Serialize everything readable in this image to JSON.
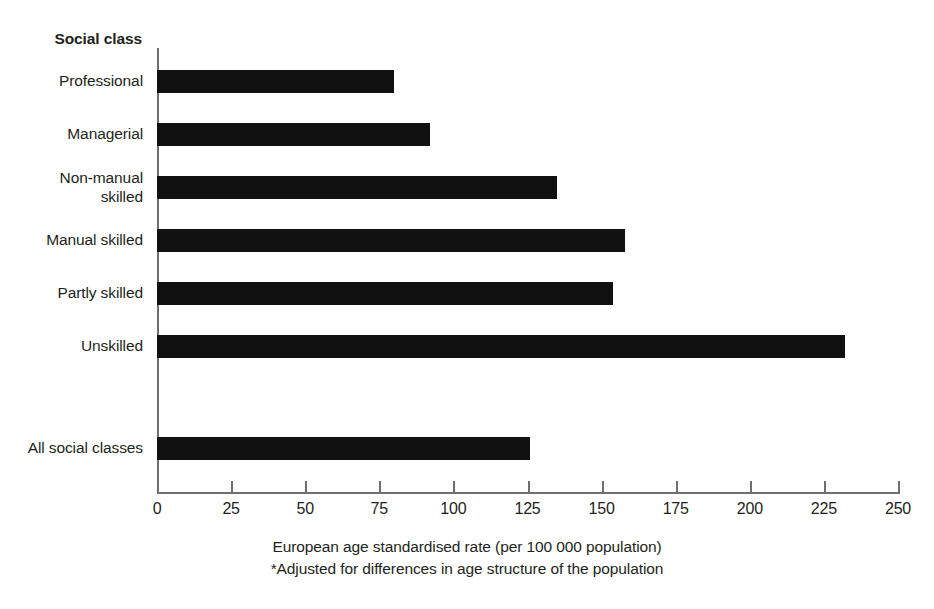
{
  "chart_data": {
    "type": "bar",
    "orientation": "horizontal",
    "title": "",
    "subtitle": "",
    "y_axis_header": "Social class",
    "categories": [
      "Professional",
      "Managerial",
      "Non-manual\nskilled",
      "Manual skilled",
      "Partly skilled",
      "Unskilled",
      "All social classes"
    ],
    "category_labels": [
      {
        "lines": [
          "Professional"
        ]
      },
      {
        "lines": [
          "Managerial"
        ]
      },
      {
        "lines": [
          "Non-manual",
          "skilled"
        ]
      },
      {
        "lines": [
          "Manual skilled"
        ]
      },
      {
        "lines": [
          "Partly skilled"
        ]
      },
      {
        "lines": [
          "Unskilled"
        ]
      },
      {
        "lines": [
          "All social classes"
        ]
      }
    ],
    "values": [
      80,
      92,
      135,
      158,
      154,
      232,
      126
    ],
    "xlabel": "European age standardised rate (per 100 000 population)",
    "ylabel": "Social class",
    "xlim": [
      0,
      250
    ],
    "xticks": [
      0,
      25,
      50,
      75,
      100,
      125,
      150,
      175,
      200,
      225,
      250
    ],
    "tick_labels": [
      "0",
      "25",
      "50",
      "75",
      "100",
      "125",
      "150",
      "175",
      "200",
      "225",
      "250"
    ],
    "grid": false,
    "legend": null,
    "bar_color": "#111111",
    "axis_color": "#6d6e71",
    "text_color": "#231f20",
    "background": "#ffffff",
    "footnote": "*Adjusted for differences in age structure of the population"
  },
  "captions": {
    "axis_title": "European age standardised rate (per 100 000 population)",
    "footnote": "*Adjusted for differences in age structure of the population"
  }
}
